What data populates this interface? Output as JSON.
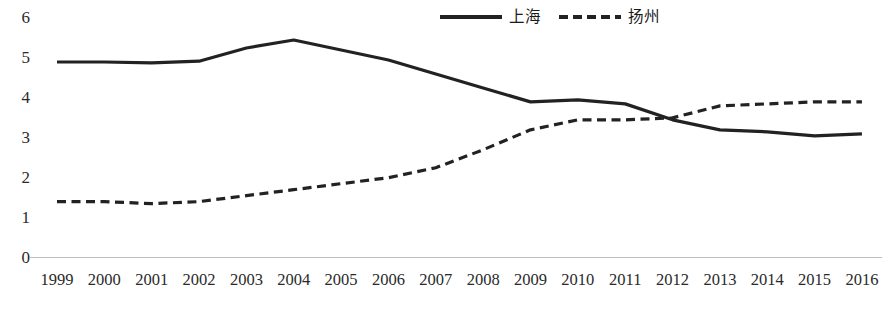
{
  "chart_data": {
    "type": "line",
    "title": "",
    "xlabel": "",
    "ylabel": "",
    "categories": [
      "1999",
      "2000",
      "2001",
      "2002",
      "2003",
      "2004",
      "2005",
      "2006",
      "2007",
      "2008",
      "2009",
      "2010",
      "2011",
      "2012",
      "2013",
      "2014",
      "2015",
      "2016"
    ],
    "ylim": [
      0,
      6
    ],
    "yticks": [
      0,
      1,
      2,
      3,
      4,
      5,
      6
    ],
    "grid": false,
    "legend_position": "top-center",
    "series": [
      {
        "name": "上海",
        "style": "solid",
        "color": "#222222",
        "values": [
          4.9,
          4.9,
          4.88,
          4.92,
          5.25,
          5.45,
          5.2,
          4.95,
          4.6,
          4.25,
          3.9,
          3.95,
          3.85,
          3.45,
          3.2,
          3.15,
          3.05,
          3.1
        ]
      },
      {
        "name": "扬州",
        "style": "dashed",
        "color": "#222222",
        "values": [
          1.4,
          1.4,
          1.35,
          1.4,
          1.55,
          1.7,
          1.85,
          2.0,
          2.25,
          2.7,
          3.2,
          3.45,
          3.45,
          3.5,
          3.8,
          3.85,
          3.9,
          3.9
        ]
      }
    ],
    "axis_line_color": "#bdbdbd"
  },
  "legend": {
    "entries": [
      {
        "label": "上海",
        "swatch": "solid-line-swatch"
      },
      {
        "label": "扬州",
        "swatch": "dashed-line-swatch"
      }
    ]
  }
}
